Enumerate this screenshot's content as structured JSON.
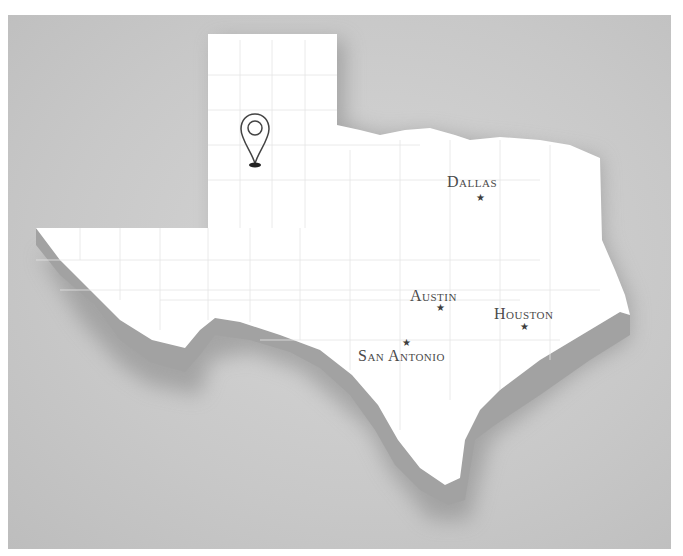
{
  "map": {
    "region": "Texas",
    "colors": {
      "background": "#c8c8c8",
      "land": "#ffffff",
      "extrusion": "#9a9a9a",
      "county_lines": "#e6e6e6",
      "label": "#4a4a4a",
      "marker": "#3c3c3c"
    },
    "pin": {
      "icon": "location-pin-icon"
    },
    "cities": [
      {
        "name": "Dallas",
        "label_x": 447,
        "label_y": 173,
        "star_x": 476,
        "star_y": 193
      },
      {
        "name": "Austin",
        "label_x": 410,
        "label_y": 287,
        "star_x": 436,
        "star_y": 303
      },
      {
        "name": "Houston",
        "label_x": 494,
        "label_y": 305,
        "star_x": 520,
        "star_y": 322
      },
      {
        "name": "San Antonio",
        "label_x": 358,
        "label_y": 347,
        "star_x": 402,
        "star_y": 338
      }
    ]
  }
}
